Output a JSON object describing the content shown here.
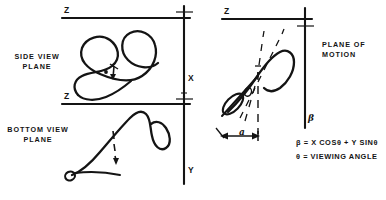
{
  "figure": {
    "title_implicit": "Viewing-geometry diagram: side view, bottom view and plane of motion",
    "background_color": "#ffffff",
    "ink_color": "#141414"
  },
  "panels": [
    {
      "id": "side-view",
      "label_line1": "SIDE VIEW",
      "label_line2": "PLANE",
      "horizontal_axis_label": "Z",
      "vertical_axis_label": "X",
      "marker": "theta-tick"
    },
    {
      "id": "bottom-view",
      "label_line1": "BOTTOM VIEW",
      "label_line2": "PLANE",
      "horizontal_axis_label": "Z",
      "vertical_axis_label": "Y",
      "marker": "dashed-arrow"
    },
    {
      "id": "plane-of-motion",
      "label_line1": "PLANE OF",
      "label_line2": "MOTION",
      "horizontal_axis_label": "Z",
      "vertical_axis_label": "β",
      "angle_label": "a",
      "angle_symbol_on_curve": "θ"
    }
  ],
  "equations": [
    {
      "id": "beta-equation",
      "text": "β = X COSθ + Y SINθ",
      "parts": {
        "lhs": "β",
        "eq": "=",
        "term1": "X COSθ",
        "plus": "+",
        "term2": "Y SINθ"
      }
    },
    {
      "id": "theta-definition",
      "text": "θ = VIEWING ANGLE",
      "parts": {
        "lhs": "θ",
        "eq": "=",
        "rhs": "VIEWING ANGLE"
      }
    }
  ],
  "axis_labels": {
    "side_z": "Z",
    "side_x": "X",
    "bottom_z": "Z",
    "bottom_y": "Y",
    "motion_z": "Z",
    "motion_beta": "β",
    "alpha": "a"
  },
  "panel_labels": {
    "side_line1": "SIDE VIEW",
    "side_line2": "PLANE",
    "bottom_line1": "BOTTOM VIEW",
    "bottom_line2": "PLANE",
    "motion_line1": "PLANE OF",
    "motion_line2": "MOTION"
  },
  "equation_text": {
    "beta": "β = X COSθ + Y SINθ",
    "theta": "θ = VIEWING ANGLE"
  }
}
